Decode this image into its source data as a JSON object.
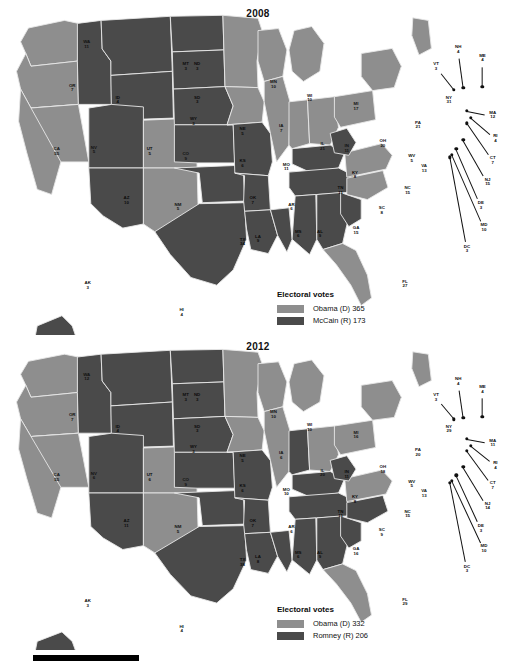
{
  "figure": {
    "type": "choropleth-map-pair",
    "scale_bar": true
  },
  "colors": {
    "democrat": "#8e8e8e",
    "republican": "#4a4a4a",
    "background": "#ffffff",
    "border": "#e8e8e8",
    "text": "#111111"
  },
  "maps": [
    {
      "id": "map2008",
      "title": "2008",
      "legend": {
        "title": "Electoral votes",
        "entries": [
          {
            "label": "Obama (D) 365",
            "party": "democrat",
            "candidate": "Obama",
            "votes": 365
          },
          {
            "label": "McCain (R) 173",
            "party": "republican",
            "candidate": "McCain",
            "votes": 173
          }
        ]
      },
      "states": [
        {
          "ab": "WA",
          "ev": "11",
          "party": "d"
        },
        {
          "ab": "OR",
          "ev": "7",
          "party": "d"
        },
        {
          "ab": "CA",
          "ev": "55",
          "party": "d"
        },
        {
          "ab": "NV",
          "ev": "5",
          "party": "d"
        },
        {
          "ab": "ID",
          "ev": "4",
          "party": "r"
        },
        {
          "ab": "MT",
          "ev": "3",
          "party": "r"
        },
        {
          "ab": "WY",
          "ev": "3",
          "party": "r"
        },
        {
          "ab": "UT",
          "ev": "5",
          "party": "r"
        },
        {
          "ab": "AZ",
          "ev": "10",
          "party": "r"
        },
        {
          "ab": "CO",
          "ev": "9",
          "party": "d"
        },
        {
          "ab": "NM",
          "ev": "5",
          "party": "d"
        },
        {
          "ab": "ND",
          "ev": "3",
          "party": "r"
        },
        {
          "ab": "SD",
          "ev": "3",
          "party": "r"
        },
        {
          "ab": "NE",
          "ev": "5",
          "party": "r"
        },
        {
          "ab": "KS",
          "ev": "6",
          "party": "r"
        },
        {
          "ab": "OK",
          "ev": "7",
          "party": "r"
        },
        {
          "ab": "TX",
          "ev": "34",
          "party": "r"
        },
        {
          "ab": "MN",
          "ev": "10",
          "party": "d"
        },
        {
          "ab": "IA",
          "ev": "7",
          "party": "d"
        },
        {
          "ab": "MO",
          "ev": "11",
          "party": "r"
        },
        {
          "ab": "AR",
          "ev": "6",
          "party": "r"
        },
        {
          "ab": "LA",
          "ev": "9",
          "party": "r"
        },
        {
          "ab": "WI",
          "ev": "10",
          "party": "d"
        },
        {
          "ab": "IL",
          "ev": "21",
          "party": "d"
        },
        {
          "ab": "MS",
          "ev": "6",
          "party": "r"
        },
        {
          "ab": "MI",
          "ev": "17",
          "party": "d"
        },
        {
          "ab": "IN",
          "ev": "11",
          "party": "d"
        },
        {
          "ab": "OH",
          "ev": "20",
          "party": "d"
        },
        {
          "ab": "KY",
          "ev": "8",
          "party": "r"
        },
        {
          "ab": "TN",
          "ev": "11",
          "party": "r"
        },
        {
          "ab": "AL",
          "ev": "9",
          "party": "r"
        },
        {
          "ab": "GA",
          "ev": "15",
          "party": "r"
        },
        {
          "ab": "FL",
          "ev": "27",
          "party": "d"
        },
        {
          "ab": "SC",
          "ev": "8",
          "party": "r"
        },
        {
          "ab": "NC",
          "ev": "15",
          "party": "d"
        },
        {
          "ab": "VA",
          "ev": "13",
          "party": "d"
        },
        {
          "ab": "WV",
          "ev": "5",
          "party": "r"
        },
        {
          "ab": "PA",
          "ev": "21",
          "party": "d"
        },
        {
          "ab": "NY",
          "ev": "31",
          "party": "d"
        },
        {
          "ab": "VT",
          "ev": "3",
          "party": "d"
        },
        {
          "ab": "NH",
          "ev": "4",
          "party": "d"
        },
        {
          "ab": "ME",
          "ev": "4",
          "party": "d"
        },
        {
          "ab": "MA",
          "ev": "12",
          "party": "d"
        },
        {
          "ab": "RI",
          "ev": "4",
          "party": "d"
        },
        {
          "ab": "CT",
          "ev": "7",
          "party": "d"
        },
        {
          "ab": "NJ",
          "ev": "15",
          "party": "d"
        },
        {
          "ab": "DE",
          "ev": "3",
          "party": "d"
        },
        {
          "ab": "MD",
          "ev": "10",
          "party": "d"
        },
        {
          "ab": "DC",
          "ev": "3",
          "party": "d"
        },
        {
          "ab": "AK",
          "ev": "3",
          "party": "r"
        },
        {
          "ab": "HI",
          "ev": "4",
          "party": "d"
        }
      ]
    },
    {
      "id": "map2012",
      "title": "2012",
      "legend": {
        "title": "Electoral votes",
        "entries": [
          {
            "label": "Obama (D) 332",
            "party": "democrat",
            "candidate": "Obama",
            "votes": 332
          },
          {
            "label": "Romney (R) 206",
            "party": "republican",
            "candidate": "Romney",
            "votes": 206
          }
        ]
      },
      "states": [
        {
          "ab": "WA",
          "ev": "12",
          "party": "d"
        },
        {
          "ab": "OR",
          "ev": "7",
          "party": "d"
        },
        {
          "ab": "CA",
          "ev": "55",
          "party": "d"
        },
        {
          "ab": "NV",
          "ev": "6",
          "party": "d"
        },
        {
          "ab": "ID",
          "ev": "4",
          "party": "r"
        },
        {
          "ab": "MT",
          "ev": "3",
          "party": "r"
        },
        {
          "ab": "WY",
          "ev": "3",
          "party": "r"
        },
        {
          "ab": "UT",
          "ev": "6",
          "party": "r"
        },
        {
          "ab": "AZ",
          "ev": "11",
          "party": "r"
        },
        {
          "ab": "CO",
          "ev": "9",
          "party": "d"
        },
        {
          "ab": "NM",
          "ev": "5",
          "party": "d"
        },
        {
          "ab": "ND",
          "ev": "3",
          "party": "r"
        },
        {
          "ab": "SD",
          "ev": "3",
          "party": "r"
        },
        {
          "ab": "NE",
          "ev": "5",
          "party": "r"
        },
        {
          "ab": "KS",
          "ev": "6",
          "party": "r"
        },
        {
          "ab": "OK",
          "ev": "7",
          "party": "r"
        },
        {
          "ab": "TX",
          "ev": "38",
          "party": "r"
        },
        {
          "ab": "MN",
          "ev": "10",
          "party": "d"
        },
        {
          "ab": "IA",
          "ev": "6",
          "party": "d"
        },
        {
          "ab": "MO",
          "ev": "10",
          "party": "r"
        },
        {
          "ab": "AR",
          "ev": "6",
          "party": "r"
        },
        {
          "ab": "LA",
          "ev": "8",
          "party": "r"
        },
        {
          "ab": "WI",
          "ev": "10",
          "party": "d"
        },
        {
          "ab": "IL",
          "ev": "20",
          "party": "d"
        },
        {
          "ab": "MS",
          "ev": "6",
          "party": "r"
        },
        {
          "ab": "MI",
          "ev": "16",
          "party": "d"
        },
        {
          "ab": "IN",
          "ev": "11",
          "party": "r"
        },
        {
          "ab": "OH",
          "ev": "18",
          "party": "d"
        },
        {
          "ab": "KY",
          "ev": "8",
          "party": "r"
        },
        {
          "ab": "TN",
          "ev": "11",
          "party": "r"
        },
        {
          "ab": "AL",
          "ev": "9",
          "party": "r"
        },
        {
          "ab": "GA",
          "ev": "16",
          "party": "r"
        },
        {
          "ab": "FL",
          "ev": "29",
          "party": "d"
        },
        {
          "ab": "SC",
          "ev": "9",
          "party": "r"
        },
        {
          "ab": "NC",
          "ev": "15",
          "party": "r"
        },
        {
          "ab": "VA",
          "ev": "13",
          "party": "d"
        },
        {
          "ab": "WV",
          "ev": "5",
          "party": "r"
        },
        {
          "ab": "PA",
          "ev": "20",
          "party": "d"
        },
        {
          "ab": "NY",
          "ev": "29",
          "party": "d"
        },
        {
          "ab": "VT",
          "ev": "3",
          "party": "d"
        },
        {
          "ab": "NH",
          "ev": "4",
          "party": "d"
        },
        {
          "ab": "ME",
          "ev": "4",
          "party": "d"
        },
        {
          "ab": "MA",
          "ev": "11",
          "party": "d"
        },
        {
          "ab": "RI",
          "ev": "4",
          "party": "d"
        },
        {
          "ab": "CT",
          "ev": "7",
          "party": "d"
        },
        {
          "ab": "NJ",
          "ev": "14",
          "party": "d"
        },
        {
          "ab": "DE",
          "ev": "3",
          "party": "d"
        },
        {
          "ab": "MD",
          "ev": "10",
          "party": "d"
        },
        {
          "ab": "DC",
          "ev": "3",
          "party": "d"
        },
        {
          "ab": "AK",
          "ev": "3",
          "party": "r"
        },
        {
          "ab": "HI",
          "ev": "4",
          "party": "d"
        }
      ]
    }
  ]
}
